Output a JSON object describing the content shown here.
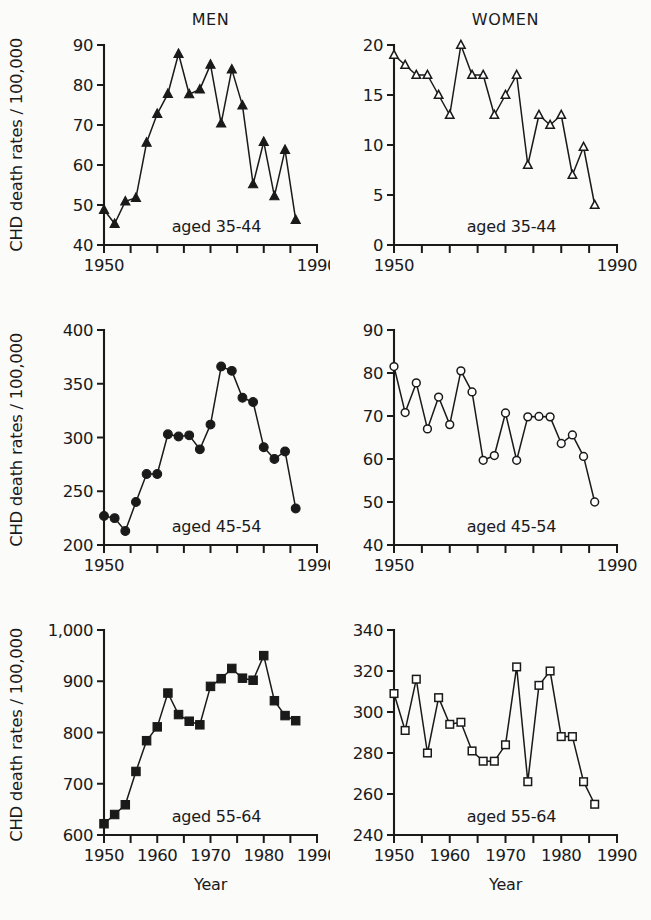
{
  "figure": {
    "column_titles": [
      "MEN",
      "WOMEN"
    ],
    "y_axis_label": "CHD death rates / 100,000",
    "x_axis_label": "Year"
  },
  "chart_data": [
    {
      "id": "men-35-44",
      "type": "line",
      "title": "MEN",
      "annotation": "aged 35-44",
      "marker": "filled-triangle",
      "xlabel": "Year",
      "ylabel": "CHD death rates / 100,000",
      "xlim": [
        1950,
        1990
      ],
      "ylim": [
        40,
        90
      ],
      "xticks": [
        1950,
        1955,
        1960,
        1965,
        1970,
        1975,
        1980,
        1985,
        1990
      ],
      "xticklabels": [
        "1950",
        "",
        "",
        "",
        "",
        "",
        "",
        "",
        "1990"
      ],
      "yticks": [
        40,
        50,
        60,
        70,
        80,
        90
      ],
      "yticklabels": [
        "40",
        "50",
        "60",
        "70",
        "80",
        "90"
      ],
      "grid": false,
      "legend": "none",
      "x": [
        1950,
        1952,
        1954,
        1956,
        1958,
        1960,
        1962,
        1964,
        1966,
        1968,
        1970,
        1972,
        1974,
        1976,
        1978,
        1980,
        1982,
        1984,
        1986
      ],
      "values": [
        48.8,
        45.3,
        50.9,
        51.8,
        65.6,
        72.8,
        77.8,
        87.8,
        77.7,
        78.9,
        85.1,
        70.4,
        83.9,
        74.9,
        55.2,
        65.8,
        52.2,
        63.8,
        46.3
      ]
    },
    {
      "id": "women-35-44",
      "type": "line",
      "title": "WOMEN",
      "annotation": "aged 35-44",
      "marker": "open-triangle",
      "xlabel": "Year",
      "ylabel": "CHD death rates / 100,000",
      "xlim": [
        1950,
        1990
      ],
      "ylim": [
        0,
        20
      ],
      "xticks": [
        1950,
        1955,
        1960,
        1965,
        1970,
        1975,
        1980,
        1985,
        1990
      ],
      "xticklabels": [
        "1950",
        "",
        "",
        "",
        "",
        "",
        "",
        "",
        "1990"
      ],
      "yticks": [
        0,
        5,
        10,
        15,
        20
      ],
      "yticklabels": [
        "0",
        "5",
        "10",
        "15",
        "20"
      ],
      "grid": false,
      "legend": "none",
      "x": [
        1950,
        1952,
        1954,
        1956,
        1958,
        1960,
        1962,
        1964,
        1966,
        1968,
        1970,
        1972,
        1974,
        1976,
        1978,
        1980,
        1982,
        1984,
        1986
      ],
      "values": [
        19.0,
        18.0,
        17.0,
        17.0,
        15.0,
        13.0,
        20.0,
        17.0,
        17.0,
        13.0,
        15.0,
        17.0,
        8.0,
        13.0,
        12.0,
        13.0,
        7.0,
        9.8,
        4.0
      ]
    },
    {
      "id": "men-45-54",
      "type": "line",
      "title": "MEN",
      "annotation": "aged 45-54",
      "marker": "filled-circle",
      "xlabel": "Year",
      "ylabel": "CHD death rates / 100,000",
      "xlim": [
        1950,
        1990
      ],
      "ylim": [
        200,
        400
      ],
      "xticks": [
        1950,
        1955,
        1960,
        1965,
        1970,
        1975,
        1980,
        1985,
        1990
      ],
      "xticklabels": [
        "1950",
        "",
        "",
        "",
        "",
        "",
        "",
        "",
        "1990"
      ],
      "yticks": [
        200,
        250,
        300,
        350,
        400
      ],
      "yticklabels": [
        "200",
        "250",
        "300",
        "350",
        "400"
      ],
      "grid": false,
      "legend": "none",
      "x": [
        1950,
        1952,
        1954,
        1956,
        1958,
        1960,
        1962,
        1964,
        1966,
        1968,
        1970,
        1972,
        1974,
        1976,
        1978,
        1980,
        1982,
        1984,
        1986
      ],
      "values": [
        227,
        225,
        213,
        240,
        266,
        266,
        303,
        301,
        302,
        289,
        312,
        366,
        362,
        337,
        333,
        291,
        280,
        287,
        234
      ]
    },
    {
      "id": "women-45-54",
      "type": "line",
      "title": "WOMEN",
      "annotation": "aged 45-54",
      "marker": "open-circle",
      "xlabel": "Year",
      "ylabel": "CHD death rates / 100,000",
      "xlim": [
        1950,
        1990
      ],
      "ylim": [
        40,
        90
      ],
      "xticks": [
        1950,
        1955,
        1960,
        1965,
        1970,
        1975,
        1980,
        1985,
        1990
      ],
      "xticklabels": [
        "1950",
        "",
        "",
        "",
        "",
        "",
        "",
        "",
        "1990"
      ],
      "yticks": [
        40,
        50,
        60,
        70,
        80,
        90
      ],
      "yticklabels": [
        "40",
        "50",
        "60",
        "70",
        "80",
        "90"
      ],
      "grid": false,
      "legend": "none",
      "x": [
        1950,
        1952,
        1954,
        1956,
        1958,
        1960,
        1962,
        1964,
        1966,
        1968,
        1970,
        1972,
        1974,
        1976,
        1978,
        1980,
        1982,
        1984,
        1986
      ],
      "values": [
        81.5,
        70.8,
        77.7,
        67.0,
        74.4,
        68.0,
        80.5,
        75.6,
        59.7,
        60.8,
        70.7,
        59.7,
        69.8,
        69.9,
        69.8,
        63.6,
        65.6,
        60.6,
        50.0
      ]
    },
    {
      "id": "men-55-64",
      "type": "line",
      "title": "MEN",
      "annotation": "aged 55-64",
      "marker": "filled-square",
      "xlabel": "Year",
      "ylabel": "CHD death rates / 100,000",
      "xlim": [
        1950,
        1990
      ],
      "ylim": [
        600,
        1000
      ],
      "xticks": [
        1950,
        1955,
        1960,
        1965,
        1970,
        1975,
        1980,
        1985,
        1990
      ],
      "xticklabels": [
        "1950",
        "1960",
        "1970",
        "1980",
        "1990"
      ],
      "yticks": [
        600,
        700,
        800,
        900,
        1000
      ],
      "yticklabels": [
        "600",
        "700",
        "800",
        "900",
        "1,000"
      ],
      "grid": false,
      "legend": "none",
      "x": [
        1950,
        1952,
        1954,
        1956,
        1958,
        1960,
        1962,
        1964,
        1966,
        1968,
        1970,
        1972,
        1974,
        1976,
        1978,
        1980,
        1982,
        1984,
        1986
      ],
      "values": [
        622,
        640,
        659,
        724,
        784,
        811,
        877,
        835,
        822,
        815,
        890,
        905,
        925,
        906,
        902,
        950,
        862,
        833,
        823
      ]
    },
    {
      "id": "women-55-64",
      "type": "line",
      "title": "WOMEN",
      "annotation": "aged 55-64",
      "marker": "open-square",
      "xlabel": "Year",
      "ylabel": "CHD death rates / 100,000",
      "xlim": [
        1950,
        1990
      ],
      "ylim": [
        240,
        340
      ],
      "xticks": [
        1950,
        1955,
        1960,
        1965,
        1970,
        1975,
        1980,
        1985,
        1990
      ],
      "xticklabels": [
        "1950",
        "1960",
        "1970",
        "1980",
        "1990"
      ],
      "yticks": [
        240,
        260,
        280,
        300,
        320,
        340
      ],
      "yticklabels": [
        "240",
        "260",
        "280",
        "300",
        "320",
        "340"
      ],
      "grid": false,
      "legend": "none",
      "x": [
        1950,
        1952,
        1954,
        1956,
        1958,
        1960,
        1962,
        1964,
        1966,
        1968,
        1970,
        1972,
        1974,
        1976,
        1978,
        1980,
        1982,
        1984,
        1986
      ],
      "values": [
        309,
        291,
        316,
        280,
        307,
        294,
        295,
        281,
        276,
        276,
        284,
        322,
        266,
        313,
        320,
        288,
        288,
        266,
        255
      ]
    }
  ]
}
